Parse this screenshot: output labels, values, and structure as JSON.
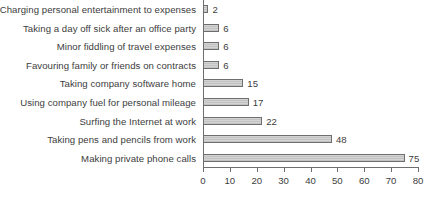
{
  "chart_data": {
    "type": "bar",
    "orientation": "horizontal",
    "title": "",
    "xlabel": "",
    "ylabel": "",
    "xlim": [
      0,
      80
    ],
    "xticks": [
      0,
      10,
      20,
      30,
      40,
      50,
      60,
      70,
      80
    ],
    "grid": false,
    "legend": null,
    "value_labels_shown": true,
    "categories": [
      "Charging personal entertainment to expenses",
      "Taking a day off sick after an office party",
      "Minor fiddling of travel expenses",
      "Favouring family or friends on contracts",
      "Taking company software home",
      "Using company fuel for personal mileage",
      "Surfing the Internet at work",
      "Taking pens and pencils from work",
      "Making private phone calls"
    ],
    "values": [
      2,
      6,
      6,
      6,
      15,
      17,
      22,
      48,
      75
    ],
    "value_text": [
      "2",
      "6",
      "6",
      "6",
      "15",
      "17",
      "22",
      "48",
      "75"
    ],
    "bar_fill_color": "#c9c9c9",
    "bar_border_color": "#6e6e6e",
    "axis_color": "#6e6e6e",
    "text_color": "#3d3d3d",
    "background_color": "#ffffff"
  }
}
